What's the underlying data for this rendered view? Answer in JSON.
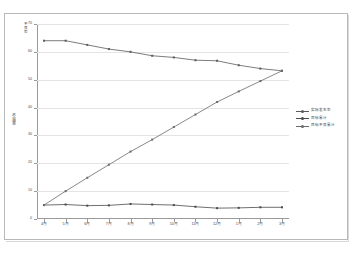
{
  "chart_data": {
    "type": "line",
    "title": "",
    "xlabel": "",
    "ylabel": "不良率",
    "yunit": "不良率",
    "ylim": [
      0,
      70
    ],
    "yticks": [
      0,
      10,
      20,
      30,
      40,
      50,
      60,
      70
    ],
    "ytick_labels": [
      "0",
      "10",
      "20",
      "30",
      "40",
      "50",
      "60",
      "70"
    ],
    "grid": true,
    "legend_position": "right",
    "categories": [
      "4月",
      "5月",
      "6月",
      "7月",
      "8月",
      "9月",
      "10月",
      "11月",
      "12月",
      "1月",
      "2月",
      "3月"
    ],
    "series": [
      {
        "name": "实际发生率",
        "color": "#5b5b5b",
        "values": [
          64.0,
          64.0,
          62.5,
          61.0,
          60.0,
          58.6,
          58.0,
          57.0,
          56.8,
          55.2,
          54.0,
          53.2
        ]
      },
      {
        "name": "目标累计",
        "color": "#4a4a4a",
        "values": [
          5.0,
          5.2,
          4.8,
          4.9,
          5.4,
          5.2,
          5.0,
          4.4,
          3.9,
          4.0,
          4.2,
          4.2
        ]
      },
      {
        "name": "目标不良累计",
        "color": "#6a6a6a",
        "values": [
          5.0,
          10.0,
          14.8,
          19.5,
          24.2,
          28.5,
          33.0,
          37.5,
          42.0,
          45.8,
          49.5,
          53.2
        ]
      }
    ]
  },
  "legend": {
    "items": [
      {
        "label": "实际发生率"
      },
      {
        "label": "目标累计"
      },
      {
        "label": "目标不良累计"
      }
    ]
  },
  "axes": {
    "y_title": "不良率",
    "y_unit": "不良率"
  }
}
